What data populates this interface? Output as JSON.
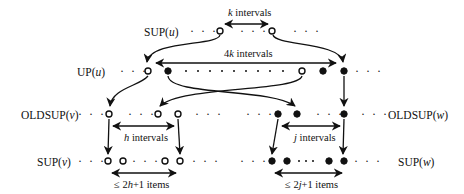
{
  "rows": {
    "sup_u": {
      "label": "SUP(",
      "var": "u",
      "close": ")"
    },
    "up_u": {
      "label": "UP(",
      "var": "u",
      "close": ")"
    },
    "oldsup_v": {
      "label": "OLDSUP(",
      "var": "v",
      "close": ")"
    },
    "oldsup_w": {
      "label": "OLDSUP(",
      "var": "w",
      "close": ")"
    },
    "sup_v": {
      "label": "SUP(",
      "var": "v",
      "close": ")"
    },
    "sup_w": {
      "label": "SUP(",
      "var": "w",
      "close": ")"
    }
  },
  "annotations": {
    "k_intervals": {
      "var": "k",
      "text": " intervals"
    },
    "4k_intervals": {
      "num": "4",
      "var": "k",
      "text": " intervals"
    },
    "h_intervals": {
      "var": "h",
      "text": " intervals"
    },
    "j_intervals": {
      "var": "j",
      "text": " intervals"
    },
    "sup_v_items": {
      "prefix": "≤ 2",
      "var": "h",
      "suffix": "+1 items"
    },
    "sup_w_items": {
      "prefix": "≤ 2",
      "var": "j",
      "suffix": "+1 items"
    }
  },
  "ellipsis": "· · ·",
  "legend": {
    "open_circle": "item from v side",
    "filled_circle": "item from w side"
  }
}
